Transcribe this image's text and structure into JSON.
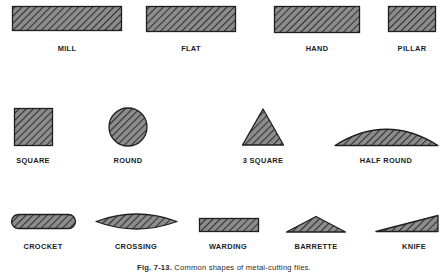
{
  "figure": {
    "caption_bold": "Fig. 7-13.",
    "caption_rest": "Common shapes of metal-cutting files.",
    "style": {
      "fill_color": "#8c8c8c",
      "hatch_color": "#2f2f2f",
      "outline_color": "#1f1f1f",
      "label_color": "#1b1b1b",
      "background": "#ffffff"
    },
    "rows": [
      {
        "row": "top",
        "items": [
          {
            "label": "MILL",
            "shape": "rectangle"
          },
          {
            "label": "FLAT",
            "shape": "rectangle"
          },
          {
            "label": "HAND",
            "shape": "rectangle"
          },
          {
            "label": "PILLAR",
            "shape": "rectangle"
          }
        ]
      },
      {
        "row": "middle",
        "items": [
          {
            "label": "SQUARE",
            "shape": "square"
          },
          {
            "label": "ROUND",
            "shape": "circle"
          },
          {
            "label": "3 SQUARE",
            "shape": "triangle"
          },
          {
            "label": "HALF ROUND",
            "shape": "half-round"
          }
        ]
      },
      {
        "row": "bottom",
        "items": [
          {
            "label": "CROCKET",
            "shape": "rounded-pill"
          },
          {
            "label": "CROSSING",
            "shape": "lens"
          },
          {
            "label": "WARDING",
            "shape": "rectangle"
          },
          {
            "label": "BARRETTE",
            "shape": "low-triangle"
          },
          {
            "label": "KNIFE",
            "shape": "wedge"
          }
        ]
      }
    ]
  }
}
